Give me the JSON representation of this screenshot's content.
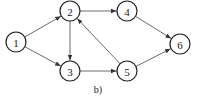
{
  "caption": "b)",
  "nodes": [
    {
      "id": "1",
      "label": "1",
      "x": 16,
      "y": 42
    },
    {
      "id": "2",
      "label": "2",
      "x": 70,
      "y": 11
    },
    {
      "id": "3",
      "label": "3",
      "x": 70,
      "y": 71
    },
    {
      "id": "4",
      "label": "4",
      "x": 127,
      "y": 11
    },
    {
      "id": "5",
      "label": "5",
      "x": 127,
      "y": 71
    },
    {
      "id": "6",
      "label": "6",
      "x": 180,
      "y": 44
    }
  ],
  "edges": [
    {
      "from": "1",
      "to": "2"
    },
    {
      "from": "1",
      "to": "3"
    },
    {
      "from": "2",
      "to": "4"
    },
    {
      "from": "2",
      "to": "3"
    },
    {
      "from": "3",
      "to": "5"
    },
    {
      "from": "5",
      "to": "2"
    },
    {
      "from": "4",
      "to": "6"
    },
    {
      "from": "5",
      "to": "6"
    }
  ],
  "style": {
    "stroke": "#222222",
    "background": "#ffffff"
  }
}
